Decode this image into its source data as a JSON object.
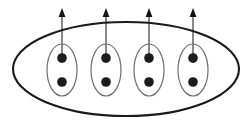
{
  "figure": {
    "name": "spin-pair-ensemble-diagram",
    "width": 251,
    "height": 125,
    "background_color": "#ffffff",
    "outer_boundary": {
      "name": "outer-ellipse",
      "shape": "ellipse",
      "cx": 126,
      "cy": 69,
      "rx": 113,
      "ry": 47,
      "stroke_color": "#1a1a1a",
      "stroke_width": 2.1,
      "fill": "none"
    },
    "pair_defaults": {
      "shape": "ellipse",
      "rx": 15,
      "ry": 26,
      "stroke_color": "#6e6e6e",
      "stroke_width": 1.2,
      "fill": "none",
      "dot_radius": 4.8,
      "dot_color": "#1c1c1c",
      "dot_offset_y": 12
    },
    "arrow_defaults": {
      "shaft_color": "#6b6b6b",
      "shaft_width": 1.6,
      "head_color": "#121212",
      "head_half_width": 3.4,
      "head_length": 9,
      "tip_y": 8,
      "tail_y": 63
    },
    "pairs": [
      {
        "id": 1,
        "label": "pair-1",
        "cx": 62,
        "cy": 70,
        "dots": 2,
        "arrow_direction": "up"
      },
      {
        "id": 2,
        "label": "pair-2",
        "cx": 106,
        "cy": 70,
        "dots": 2,
        "arrow_direction": "up"
      },
      {
        "id": 3,
        "label": "pair-3",
        "cx": 149,
        "cy": 70,
        "dots": 2,
        "arrow_direction": "up"
      },
      {
        "id": 4,
        "label": "pair-4",
        "cx": 193,
        "cy": 70,
        "dots": 2,
        "arrow_direction": "up"
      }
    ]
  }
}
